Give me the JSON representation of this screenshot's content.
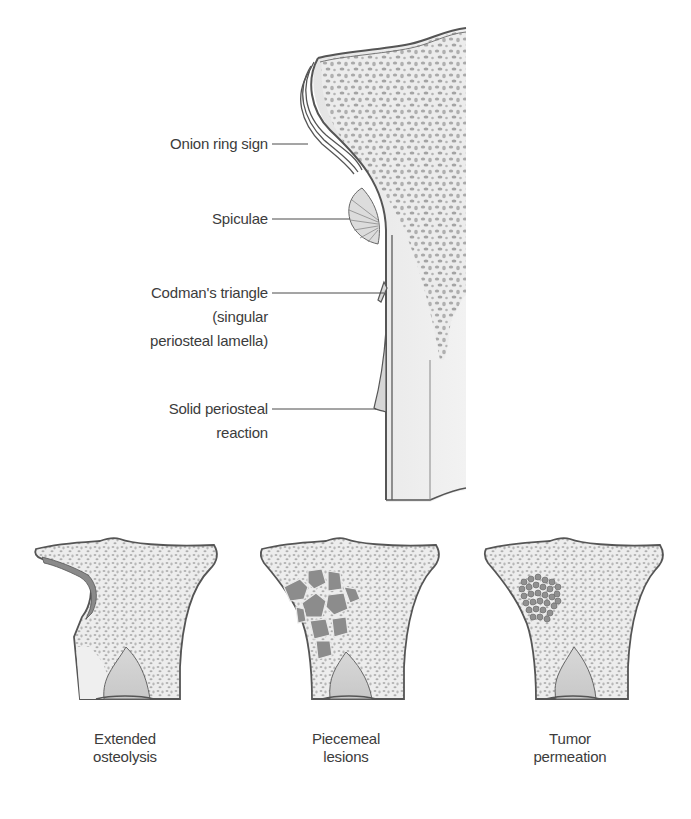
{
  "diagram": {
    "main_figure": {
      "subject": "periosteal reactions on long bone",
      "labels": [
        {
          "id": "onion-ring",
          "text": "Onion ring sign"
        },
        {
          "id": "spiculae",
          "text": "Spiculae"
        },
        {
          "id": "codman-line1",
          "text": "Codman's triangle"
        },
        {
          "id": "codman-line2",
          "text": "(singular"
        },
        {
          "id": "codman-line3",
          "text": "periosteal lamella)"
        },
        {
          "id": "solid-line1",
          "text": "Solid periosteal"
        },
        {
          "id": "solid-line2",
          "text": "reaction"
        }
      ]
    },
    "bottom_figures": [
      {
        "id": "extended-osteolysis",
        "line1": "Extended",
        "line2": "osteolysis"
      },
      {
        "id": "piecemeal-lesions",
        "line1": "Piecemeal",
        "line2": "lesions"
      },
      {
        "id": "tumor-permeation",
        "line1": "Tumor",
        "line2": "permeation"
      }
    ],
    "colors": {
      "background": "#ffffff",
      "bone_fill": "#e9e9e9",
      "trabecula": "#a8a8a8",
      "outline": "#555555",
      "lesion": "#8a8a8a",
      "text": "#3c3c3c"
    }
  }
}
